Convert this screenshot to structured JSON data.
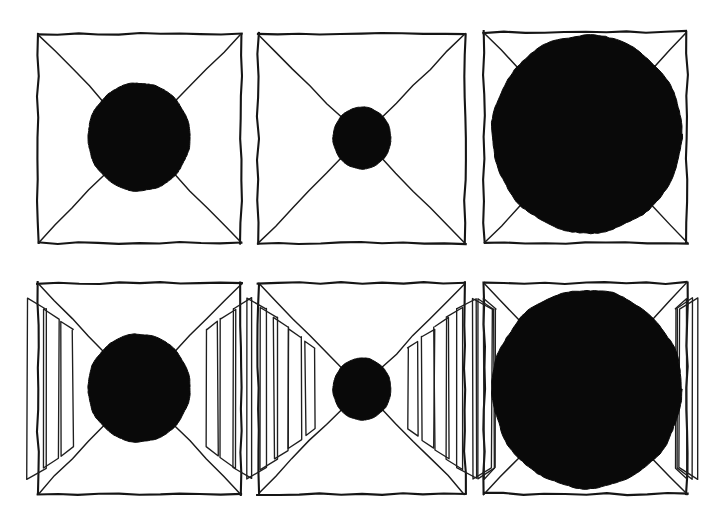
{
  "figure": {
    "title": "Perspective corridor size-constancy figure",
    "background_color": "#ffffff",
    "ink_color": "#0a0a0a",
    "width": 727,
    "height": 517,
    "rows": 2,
    "columns": 3
  },
  "panels": [
    {
      "id": "panel-top-left",
      "row": 1,
      "column": 1,
      "label": "Top left",
      "frame": {
        "x": 38,
        "y": 34,
        "width": 203,
        "height": 209
      },
      "diagonals": "both",
      "disc": {
        "cx": 139,
        "cy": 137,
        "rx": 51,
        "ry": 54,
        "size_label": "medium"
      },
      "slats_per_side": 0,
      "slat_sides": []
    },
    {
      "id": "panel-top-middle",
      "row": 1,
      "column": 2,
      "label": "Top middle",
      "frame": {
        "x": 258,
        "y": 34,
        "width": 207,
        "height": 209
      },
      "diagonals": "both",
      "disc": {
        "cx": 362,
        "cy": 138,
        "rx": 29,
        "ry": 31,
        "size_label": "small"
      },
      "slats_per_side": 0,
      "slat_sides": []
    },
    {
      "id": "panel-top-right",
      "row": 1,
      "column": 3,
      "label": "Top right",
      "frame": {
        "x": 484,
        "y": 32,
        "width": 203,
        "height": 211
      },
      "diagonals": "both",
      "disc": {
        "cx": 587,
        "cy": 134,
        "rx": 95,
        "ry": 99,
        "size_label": "large"
      },
      "slats_per_side": 0,
      "slat_sides": []
    },
    {
      "id": "panel-bottom-left",
      "row": 2,
      "column": 1,
      "label": "Bottom left",
      "frame": {
        "x": 38,
        "y": 283,
        "width": 203,
        "height": 211
      },
      "diagonals": "both",
      "disc": {
        "cx": 139,
        "cy": 388,
        "rx": 51,
        "ry": 54,
        "size_label": "medium"
      },
      "slats_per_side": 3,
      "slat_sides": [
        "left",
        "right"
      ]
    },
    {
      "id": "panel-bottom-middle",
      "row": 2,
      "column": 2,
      "label": "Bottom middle",
      "frame": {
        "x": 258,
        "y": 283,
        "width": 207,
        "height": 211
      },
      "diagonals": "both",
      "disc": {
        "cx": 362,
        "cy": 389,
        "rx": 29,
        "ry": 31,
        "size_label": "small"
      },
      "slats_per_side": 5,
      "slat_sides": [
        "left",
        "right"
      ]
    },
    {
      "id": "panel-bottom-right",
      "row": 2,
      "column": 3,
      "label": "Bottom right",
      "frame": {
        "x": 484,
        "y": 283,
        "width": 203,
        "height": 211
      },
      "diagonals": "both",
      "disc": {
        "cx": 587,
        "cy": 389,
        "rx": 95,
        "ry": 99,
        "size_label": "large"
      },
      "slats_per_side": 3,
      "slat_sides": [
        "left",
        "right"
      ]
    }
  ],
  "chart_data": {
    "type": "table",
    "categories": [
      "Top left",
      "Top middle",
      "Top right",
      "Bottom left",
      "Bottom middle",
      "Bottom right"
    ],
    "values": [
      102,
      58,
      190,
      102,
      58,
      190
    ],
    "xlabel": "Panel",
    "ylabel": "Disc diameter (px)",
    "ylim": [
      0,
      200
    ],
    "series": [
      {
        "name": "disc diameter (px)",
        "values": [
          102,
          58,
          190,
          102,
          58,
          190
        ]
      },
      {
        "name": "slats per side",
        "values": [
          0,
          0,
          0,
          3,
          5,
          3
        ]
      }
    ],
    "legend": [
      "disc diameter (px)",
      "slats per side"
    ],
    "grid": false
  }
}
